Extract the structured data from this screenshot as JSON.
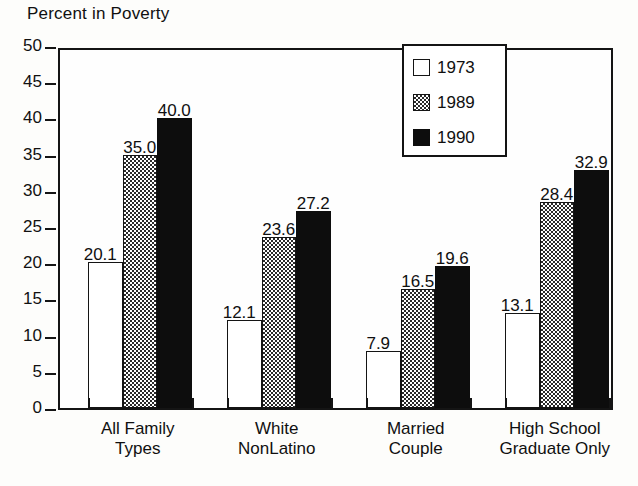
{
  "chart_data": {
    "type": "bar",
    "title": "Percent in Poverty",
    "xlabel": "",
    "ylabel": "Percent in Poverty",
    "ylim": [
      0,
      50
    ],
    "ytick_step": 5,
    "yticks": [
      50,
      45,
      40,
      35,
      30,
      25,
      20,
      15,
      10,
      5,
      0
    ],
    "grid": false,
    "legend_position": "top-right-inside",
    "categories": [
      "All Family Types",
      "White NonLatino",
      "Married Couple",
      "High School Graduate Only"
    ],
    "category_lines": [
      [
        "All Family",
        "Types"
      ],
      [
        "White",
        "NonLatino"
      ],
      [
        "Married",
        "Couple"
      ],
      [
        "High School",
        "Graduate Only"
      ]
    ],
    "series": [
      {
        "name": "1973",
        "fill": "white",
        "color": "#ffffff",
        "values": [
          20.1,
          12.1,
          7.9,
          13.1
        ],
        "labels": [
          "20.1",
          "12.1",
          "7.9",
          "13.1"
        ]
      },
      {
        "name": "1989",
        "fill": "stippled",
        "color": "#9a9a9a",
        "values": [
          35.0,
          23.6,
          16.5,
          28.4
        ],
        "labels": [
          "35.0",
          "23.6",
          "16.5",
          "28.4"
        ]
      },
      {
        "name": "1990",
        "fill": "solid-black",
        "color": "#0d0d0d",
        "values": [
          40.0,
          27.2,
          19.6,
          32.9
        ],
        "labels": [
          "40.0",
          "27.2",
          "19.6",
          "32.9"
        ]
      }
    ]
  },
  "legend": {
    "items": [
      {
        "label": "1973",
        "swatch": "white-square-icon"
      },
      {
        "label": "1989",
        "swatch": "stippled-square-icon"
      },
      {
        "label": "1990",
        "swatch": "black-square-icon"
      }
    ]
  },
  "colors": {
    "ink": "#141414",
    "background": "#fdfdfb",
    "series_1973": "#ffffff",
    "series_1989": "#9a9a9a",
    "series_1990": "#0d0d0d"
  }
}
